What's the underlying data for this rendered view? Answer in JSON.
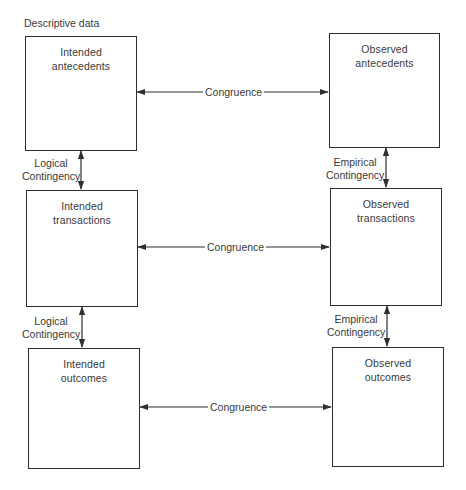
{
  "diagram": {
    "heading": "Descriptive data",
    "columns": [
      {
        "name": "Intended"
      },
      {
        "name": "Observed"
      }
    ],
    "boxes": {
      "intended_antecedents": {
        "line1": "Intended",
        "line2": "antecedents"
      },
      "intended_transactions": {
        "line1": "Intended",
        "line2": "transactions"
      },
      "intended_outcomes": {
        "line1": "Intended",
        "line2": "outcomes"
      },
      "observed_antecedents": {
        "line1": "Observed",
        "line2": "antecedents"
      },
      "observed_transactions": {
        "line1": "Observed",
        "line2": "transactions"
      },
      "observed_outcomes": {
        "line1": "Observed",
        "line2": "outcomes"
      }
    },
    "horizontal_links": [
      {
        "label": "Congruence",
        "from": "intended_antecedents",
        "to": "observed_antecedents",
        "bidirectional": true
      },
      {
        "label": "Congruence",
        "from": "intended_transactions",
        "to": "observed_transactions",
        "bidirectional": true
      },
      {
        "label": "Congruence",
        "from": "intended_outcomes",
        "to": "observed_outcomes",
        "bidirectional": true
      }
    ],
    "vertical_links": [
      {
        "line1": "Logical",
        "line2": "Contingency",
        "from": "intended_antecedents",
        "to": "intended_transactions",
        "bidirectional": true
      },
      {
        "line1": "Logical",
        "line2": "Contingency",
        "from": "intended_transactions",
        "to": "intended_outcomes",
        "bidirectional": true
      },
      {
        "line1": "Empirical",
        "line2": "Contingency",
        "from": "observed_antecedents",
        "to": "observed_transactions",
        "bidirectional": true
      },
      {
        "line1": "Empirical",
        "line2": "Contingency",
        "from": "observed_transactions",
        "to": "observed_outcomes",
        "bidirectional": true
      }
    ],
    "colors": {
      "line": "#2e2e2e",
      "text": "#3a3a3a",
      "background": "#ffffff"
    }
  }
}
